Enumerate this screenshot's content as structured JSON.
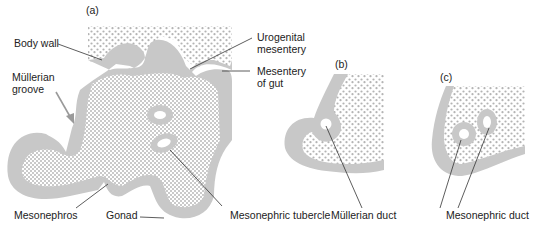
{
  "figure": {
    "panels": [
      {
        "id": "a",
        "label": "(a)"
      },
      {
        "id": "b",
        "label": "(b)"
      },
      {
        "id": "c",
        "label": "(c)"
      }
    ],
    "labels": {
      "body_wall": "Body wall",
      "mullerian_groove_1": "Müllerian",
      "mullerian_groove_2": "groove",
      "urogenital_mesentery_1": "Urogenital",
      "urogenital_mesentery_2": "mesentery",
      "mesentery_of_gut_1": "Mesentery",
      "mesentery_of_gut_2": "of gut",
      "mesonephros": "Mesonephros",
      "gonad": "Gonad",
      "mesonephric_tubercle": "Mesonephric tubercle",
      "mullerian_duct": "Müllerian duct",
      "mesonephric_duct": "Mesonephric duct"
    },
    "colors": {
      "epithelium": "#c8c8c8",
      "mesenchyme_dots": "#b4b4b4",
      "text": "#222222",
      "leader_line": "#333333",
      "arrow": "#9a9a9a"
    }
  }
}
